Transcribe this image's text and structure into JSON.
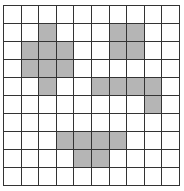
{
  "grid": {
    "rows": 10,
    "cols": 10,
    "shaded_color": "#b5b5b5",
    "line_color": "#333333",
    "shaded": [
      [
        1,
        2
      ],
      [
        1,
        6
      ],
      [
        1,
        7
      ],
      [
        2,
        1
      ],
      [
        2,
        2
      ],
      [
        2,
        3
      ],
      [
        2,
        6
      ],
      [
        2,
        7
      ],
      [
        3,
        1
      ],
      [
        3,
        2
      ],
      [
        3,
        3
      ],
      [
        4,
        2
      ],
      [
        4,
        5
      ],
      [
        4,
        6
      ],
      [
        4,
        7
      ],
      [
        4,
        8
      ],
      [
        5,
        8
      ],
      [
        7,
        3
      ],
      [
        7,
        4
      ],
      [
        7,
        5
      ],
      [
        7,
        6
      ],
      [
        8,
        4
      ],
      [
        8,
        5
      ]
    ]
  }
}
